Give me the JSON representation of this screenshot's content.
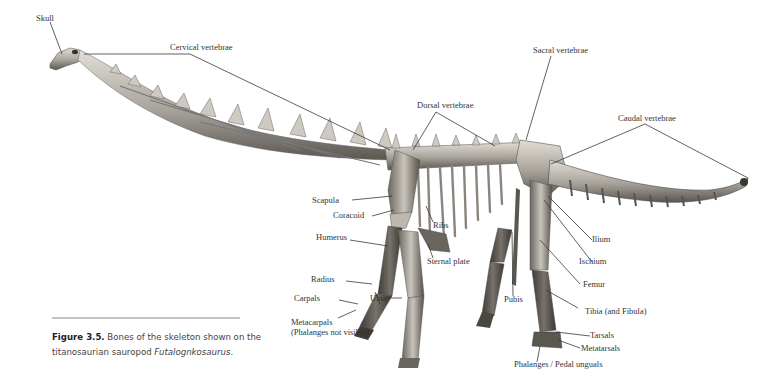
{
  "figure": {
    "number_label": "Figure 3.5.",
    "caption_text": " Bones of the skeleton shown on the titanosaurian sauropod ",
    "species": "Futalognkosaurus",
    "caption_end": "."
  },
  "labels": {
    "skull": "Skull",
    "cervical": "Cervical vertebrae",
    "dorsal": "Dorsal vertebrae",
    "sacral": "Sacral vertebrae",
    "caudal": "Caudal vertebrae",
    "scapula": "Scapula",
    "coracoid": "Coracoid",
    "ribs": "Ribs",
    "humerus": "Humerus",
    "sternal": "Sternal plate",
    "radius": "Radius",
    "carpals": "Carpals",
    "ulna": "Ulna",
    "metacarpals": "Metacarpals",
    "metacarpals_note": "(Phalanges not visible)",
    "ilium": "Ilium",
    "ischium": "Ischium",
    "femur": "Femur",
    "pubis": "Pubis",
    "tibia": "Tibia (and Fibula)",
    "tarsals": "Tarsals",
    "metatarsals": "Metatarsals",
    "phalanges": "Phalanges / Pedal unguals"
  },
  "colors": {
    "bone_light": "#d8d4cc",
    "bone_mid": "#9a958c",
    "bone_dark": "#4a4640",
    "leader_line": "#3a3a3a",
    "caption_rule": "#c4c4c4"
  }
}
